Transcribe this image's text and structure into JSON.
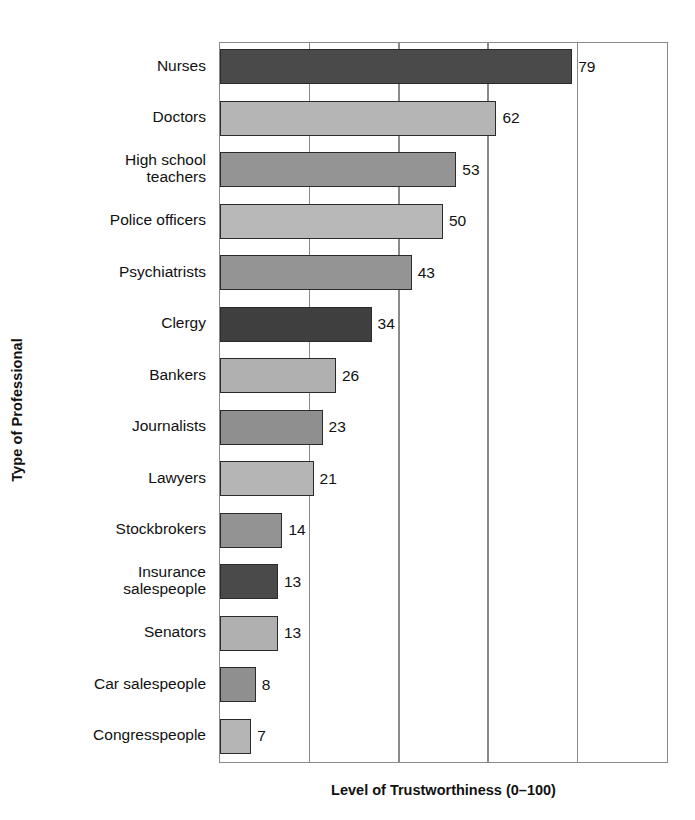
{
  "chart_data": {
    "type": "bar",
    "orientation": "horizontal",
    "title": "",
    "xlabel": "Level of Trustworthiness (0–100)",
    "ylabel": "Type of Professional",
    "xlim": [
      0,
      100
    ],
    "grid": true,
    "gridlines": [
      20,
      40,
      60,
      80
    ],
    "tick_labels_visible": false,
    "legend": "none",
    "categories": [
      "Nurses",
      "Doctors",
      "High school\nteachers",
      "Police officers",
      "Psychiatrists",
      "Clergy",
      "Bankers",
      "Journalists",
      "Lawyers",
      "Stockbrokers",
      "Insurance\nsalespeople",
      "Senators",
      "Car salespeople",
      "Congresspeople"
    ],
    "values": [
      79,
      62,
      53,
      50,
      43,
      34,
      26,
      23,
      21,
      14,
      13,
      13,
      8,
      7
    ],
    "value_labels": [
      "79",
      "62",
      "53",
      "50",
      "43",
      "34",
      "26",
      "23",
      "21",
      "14",
      "13",
      "13",
      "8",
      "7"
    ],
    "bar_colors": [
      "#4a4a4a",
      "#b5b5b5",
      "#949494",
      "#b8b8b8",
      "#949494",
      "#3f3f3f",
      "#b0b0b0",
      "#8f8f8f",
      "#b5b5b5",
      "#939393",
      "#4a4a4a",
      "#b0b0b0",
      "#8f8f8f",
      "#b5b5b5"
    ],
    "bar_edge_color": "#2b2b2b",
    "axis_color": "#8a8a8a",
    "background_color": "#ffffff",
    "text_color": "#111111"
  }
}
